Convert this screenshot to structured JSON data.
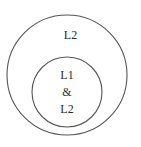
{
  "diagram": {
    "type": "nested-set-venn",
    "background_color": "#ffffff",
    "stroke_color": "#555555",
    "text_color": "#2b2b2b",
    "outer_circle": {
      "name": "outer-set",
      "label": "L2",
      "center_x": 67,
      "center_y": 75,
      "radius": 60,
      "fill": "none"
    },
    "inner_circle": {
      "name": "inner-set",
      "labels": [
        "L1",
        "&",
        "L2"
      ],
      "center_x": 67,
      "center_y": 92,
      "radius": 35,
      "fill": "none"
    }
  }
}
